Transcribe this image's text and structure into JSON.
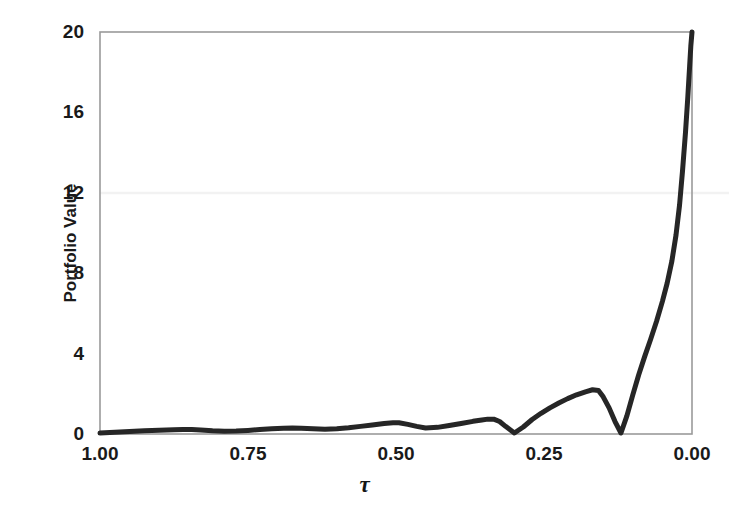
{
  "chart_data": {
    "type": "line",
    "title": "",
    "xlabel": "τ",
    "ylabel": "Portfolio Value",
    "xlim": [
      1.0,
      0.0
    ],
    "ylim": [
      0,
      20
    ],
    "x_reversed": true,
    "grid": false,
    "legend": null,
    "xticks": [
      "1.00",
      "0.75",
      "0.50",
      "0.25",
      "0.00"
    ],
    "xtick_values": [
      1.0,
      0.75,
      0.5,
      0.25,
      0.0
    ],
    "yticks": [
      "0",
      "4",
      "8",
      "12",
      "16",
      "20"
    ],
    "ytick_values": [
      0,
      4,
      8,
      12,
      16,
      20
    ],
    "series": [
      {
        "name": "Portfolio Value",
        "color": "#262626",
        "linewidth": 5,
        "x": [
          1.0,
          0.975,
          0.95,
          0.925,
          0.9,
          0.875,
          0.86,
          0.845,
          0.83,
          0.81,
          0.79,
          0.77,
          0.75,
          0.73,
          0.71,
          0.69,
          0.675,
          0.66,
          0.64,
          0.62,
          0.6,
          0.58,
          0.56,
          0.54,
          0.52,
          0.505,
          0.495,
          0.48,
          0.465,
          0.45,
          0.43,
          0.41,
          0.39,
          0.37,
          0.355,
          0.345,
          0.335,
          0.325,
          0.315,
          0.3,
          0.285,
          0.27,
          0.255,
          0.24,
          0.225,
          0.21,
          0.195,
          0.18,
          0.168,
          0.158,
          0.15,
          0.14,
          0.13,
          0.12,
          0.11,
          0.1,
          0.09,
          0.08,
          0.07,
          0.06,
          0.05,
          0.042,
          0.034,
          0.027,
          0.021,
          0.016,
          0.011,
          0.007,
          0.004,
          0.002,
          0.0
        ],
        "y": [
          0.05,
          0.09,
          0.13,
          0.16,
          0.19,
          0.21,
          0.22,
          0.22,
          0.2,
          0.16,
          0.14,
          0.15,
          0.18,
          0.22,
          0.26,
          0.29,
          0.3,
          0.29,
          0.26,
          0.24,
          0.26,
          0.31,
          0.38,
          0.45,
          0.52,
          0.56,
          0.56,
          0.48,
          0.38,
          0.3,
          0.33,
          0.42,
          0.52,
          0.63,
          0.7,
          0.74,
          0.74,
          0.62,
          0.38,
          0.05,
          0.35,
          0.72,
          1.03,
          1.3,
          1.54,
          1.76,
          1.95,
          2.1,
          2.2,
          2.16,
          1.85,
          1.3,
          0.62,
          0.05,
          0.9,
          1.95,
          2.95,
          3.85,
          4.7,
          5.6,
          6.6,
          7.5,
          8.6,
          9.9,
          11.4,
          13.1,
          15.0,
          16.8,
          18.3,
          19.3,
          20.0
        ]
      }
    ]
  },
  "axes": {
    "frame_color": "#9a9a9a",
    "plot_left_px": 100,
    "plot_right_px": 692,
    "plot_top_px": 32,
    "plot_bottom_px": 434
  }
}
